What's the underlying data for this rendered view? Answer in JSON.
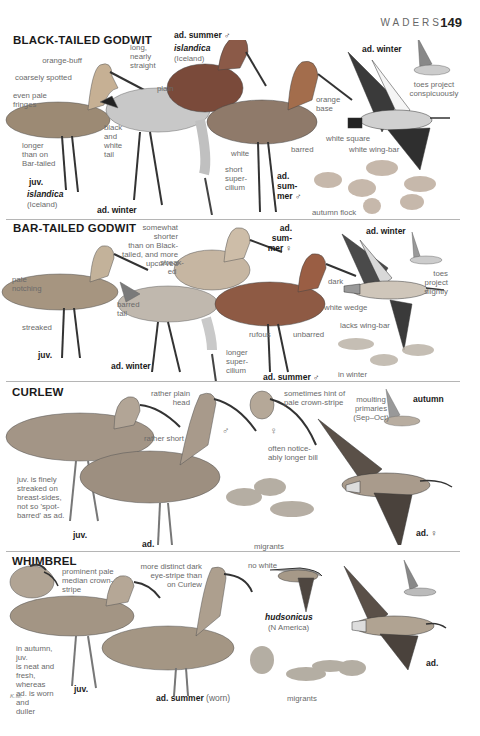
{
  "page_header": {
    "section": "WADERS",
    "page_number": "149"
  },
  "colors": {
    "background": "#ffffff",
    "heading": "#1a1a1a",
    "annotation": "#6a6a6a",
    "rule": "#b5b5b5"
  },
  "species": [
    {
      "name": "BLACK-TAILED GODWIT",
      "plates": [
        {
          "age": "juv.",
          "race": "islandica",
          "race_sub": "(Iceland)"
        },
        {
          "age": "ad. winter"
        },
        {
          "age": "ad. summer ♂",
          "race": "islandica",
          "race_sub": "(Iceland)"
        },
        {
          "age": "ad. sum-\nmer ♂"
        },
        {
          "age": "ad. winter"
        }
      ],
      "annotations": [
        "orange-buff",
        "coarsely spotted",
        "even pale\nfringes",
        "longer\nthan on\nBar-tailed",
        "long,\nnearly\nstraight",
        "black\nand\nwhite\ntail",
        "plain",
        "white",
        "short\nsuper-\ncilium",
        "orange\nbase",
        "barred",
        "white square",
        "white wing-bar",
        "toes project\nconspicuously",
        "autumn flock"
      ]
    },
    {
      "name": "BAR-TAILED GODWIT",
      "plates": [
        {
          "age": "juv."
        },
        {
          "age": "ad. winter"
        },
        {
          "age": "ad. sum-\nmer ♀"
        },
        {
          "age": "ad. summer ♂"
        },
        {
          "age": "ad. winter"
        }
      ],
      "annotations": [
        "pale\nnotching",
        "streaked",
        "somewhat shorter\nthan on Black-\ntailed, and more\nupcurved",
        "streak-\ned",
        "barred\ntail",
        "longer\nsuper-\ncilium",
        "dark",
        "rufous",
        "unbarred",
        "white wedge",
        "lacks wing-bar",
        "toes project\nslightly",
        "in winter"
      ]
    },
    {
      "name": "CURLEW",
      "plates": [
        {
          "age": "juv."
        },
        {
          "age": "ad."
        },
        {
          "age": "autumn"
        },
        {
          "age": "ad. ♀"
        }
      ],
      "annotations": [
        "rather plain\nhead",
        "rather short",
        "♂",
        "♀",
        "sometimes hint of\npale crown-stripe",
        "often notice-\nably longer bill",
        "moulting\nprimaries\n(Sep–Oct)",
        "juv. is finely\nstreaked on\nbreast-sides,\nnot so 'spot-\nbarred' as ad.",
        "migrants"
      ]
    },
    {
      "name": "WHIMBREL",
      "plates": [
        {
          "age": "juv."
        },
        {
          "age": "ad. summer",
          "age_note": "(worn)"
        },
        {
          "race": "hudsonicus",
          "race_sub": "(N America)"
        },
        {
          "age": "ad."
        }
      ],
      "annotations": [
        "prominent pale\nmedian crown-\nstripe",
        "more distinct dark\neye-stripe than\non Curlew",
        "no white",
        "in autumn, juv.\nis neat and\nfresh, whereas\nad. is worn and\nduller",
        "migrants"
      ]
    }
  ],
  "artist_signature": "K.M."
}
